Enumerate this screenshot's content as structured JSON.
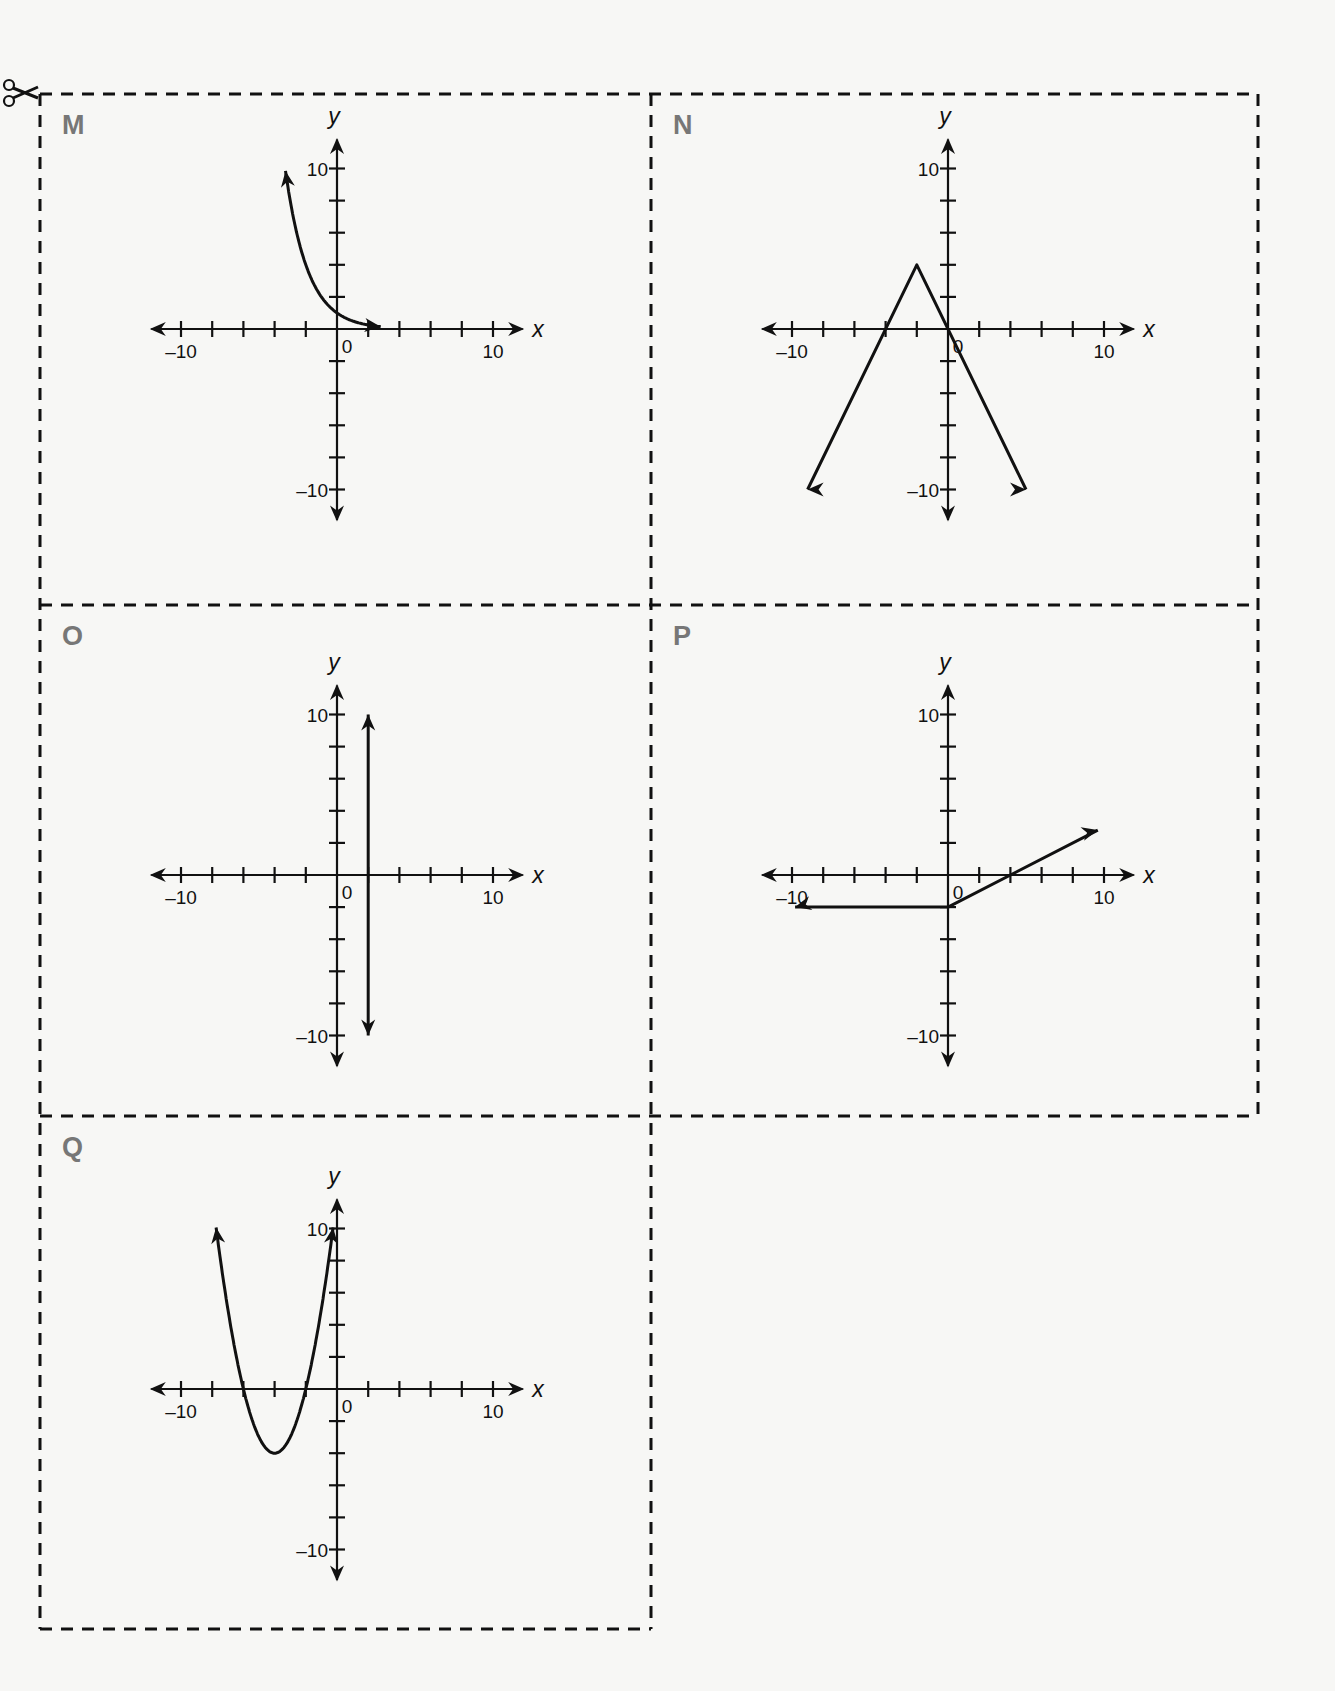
{
  "page": {
    "scissors_icon": "scissors-icon",
    "layout": {
      "columns": 2,
      "rows": 3,
      "cut_line_style": "dashed"
    }
  },
  "chart_data": [
    {
      "type": "line",
      "panel": "M",
      "title": "M",
      "xlabel": "x",
      "ylabel": "y",
      "xlim": [
        -12,
        12
      ],
      "ylim": [
        -12,
        12
      ],
      "x_tick_step": 2,
      "y_tick_step": 2,
      "x_tick_labels": [
        "-10",
        "0",
        "10"
      ],
      "y_tick_labels": [
        "10",
        "-10"
      ],
      "grid": false,
      "description": "Exponential decay curve y = (1/2)^x, arrows on both ends",
      "function": "0.5^x",
      "domain": [
        -3.3,
        2.8
      ],
      "series": [
        {
          "name": "curve",
          "x": [
            -3.3,
            -2,
            -1,
            0,
            1,
            2,
            2.8
          ],
          "y": [
            9.85,
            4,
            2,
            1,
            0.5,
            0.25,
            0.14
          ]
        }
      ]
    },
    {
      "type": "line",
      "panel": "N",
      "title": "N",
      "xlabel": "x",
      "ylabel": "y",
      "xlim": [
        -12,
        12
      ],
      "ylim": [
        -12,
        12
      ],
      "x_tick_step": 2,
      "y_tick_step": 2,
      "x_tick_labels": [
        "-10",
        "0",
        "10"
      ],
      "y_tick_labels": [
        "10",
        "-10"
      ],
      "grid": false,
      "description": "Inverted absolute value graph, vertex (-2, 4), arrows on both ends",
      "function": "-2|x+2|+4",
      "series": [
        {
          "name": "curve",
          "x": [
            -9,
            -2,
            5
          ],
          "y": [
            -10,
            4,
            -10
          ]
        }
      ]
    },
    {
      "type": "line",
      "panel": "O",
      "title": "O",
      "xlabel": "x",
      "ylabel": "y",
      "xlim": [
        -12,
        12
      ],
      "ylim": [
        -12,
        12
      ],
      "x_tick_step": 2,
      "y_tick_step": 2,
      "x_tick_labels": [
        "-10",
        "0",
        "10"
      ],
      "y_tick_labels": [
        "10",
        "-10"
      ],
      "grid": false,
      "description": "Vertical line x = 2, arrows on both ends",
      "function": "x = 2",
      "series": [
        {
          "name": "curve",
          "x": [
            2,
            2
          ],
          "y": [
            10,
            -10
          ]
        }
      ]
    },
    {
      "type": "line",
      "panel": "P",
      "title": "P",
      "xlabel": "x",
      "ylabel": "y",
      "xlim": [
        -12,
        12
      ],
      "ylim": [
        -12,
        12
      ],
      "x_tick_step": 2,
      "y_tick_step": 2,
      "x_tick_labels": [
        "-10",
        "0",
        "10"
      ],
      "y_tick_labels": [
        "10",
        "-10"
      ],
      "grid": false,
      "description": "Piecewise: y = -2 for x <= 0; y = 0.5x - 2 for x >= 0, arrows on both ends",
      "function": "piecewise",
      "series": [
        {
          "name": "curve",
          "x": [
            -9.8,
            0,
            9.6
          ],
          "y": [
            -2,
            -2,
            2.8
          ]
        }
      ]
    },
    {
      "type": "line",
      "panel": "Q",
      "title": "Q",
      "xlabel": "x",
      "ylabel": "y",
      "xlim": [
        -12,
        12
      ],
      "ylim": [
        -12,
        12
      ],
      "x_tick_step": 2,
      "y_tick_step": 2,
      "x_tick_labels": [
        "-10",
        "0",
        "10"
      ],
      "y_tick_labels": [
        "10",
        "-10"
      ],
      "grid": false,
      "description": "Upward parabola y = (x+4)^2 - 4, vertex (-4, -4), roots -6 and -2, arrows on both ends",
      "function": "(x+4)^2-4",
      "domain": [
        -7.75,
        -0.25
      ],
      "series": [
        {
          "name": "curve",
          "x": [
            -7.75,
            -6,
            -5,
            -4,
            -3,
            -2,
            -0.25
          ],
          "y": [
            10.06,
            0,
            -3,
            -4,
            -3,
            0,
            10.06
          ]
        }
      ]
    }
  ]
}
